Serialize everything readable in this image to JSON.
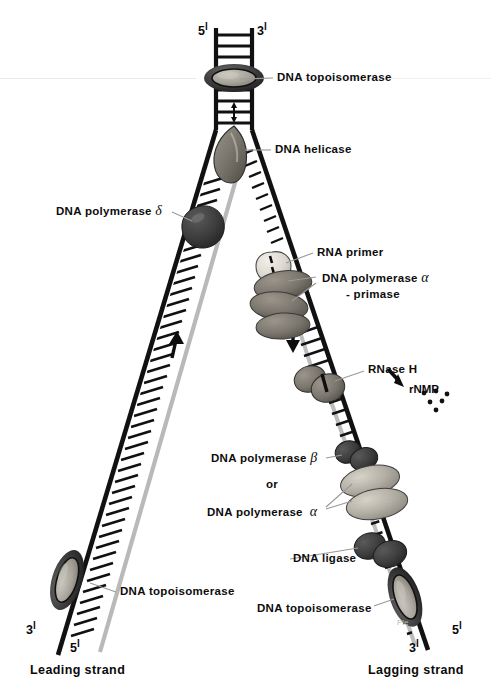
{
  "figure": {
    "background_color": "#ffffff",
    "width": 491,
    "height": 698
  },
  "colors": {
    "ink": "#0d0d0d",
    "template_strand": "#111111",
    "new_strand": "#b3b3b3",
    "leader_line": "#9a9a9a",
    "protein_dark": "#3a3a3a",
    "protein_mid": "#6e6e6e",
    "protein_light": "#b0aca4",
    "primer_light": "#e3e0d8",
    "watermark": "#b9b9b9"
  },
  "end_labels": [
    {
      "id": "top-left-5prime",
      "text": "5",
      "prime": "l",
      "x": 198,
      "y": 24
    },
    {
      "id": "top-right-3prime",
      "text": "3",
      "prime": "l",
      "x": 257,
      "y": 24
    },
    {
      "id": "bottom-left-3prime",
      "text": "3",
      "prime": "l",
      "x": 26,
      "y": 623
    },
    {
      "id": "bottom-left-5prime",
      "text": "5",
      "prime": "l",
      "x": 70,
      "y": 641
    },
    {
      "id": "bottom-right-3prime",
      "text": "3",
      "prime": "l",
      "x": 409,
      "y": 641
    },
    {
      "id": "bottom-right-5prime",
      "text": "5",
      "prime": "l",
      "x": 452,
      "y": 623
    }
  ],
  "annotations": [
    {
      "id": "dna-topoisomerase-top",
      "label": "DNA  topoisomerase",
      "x": 277,
      "y": 70,
      "leader": {
        "x1": 273,
        "y1": 78,
        "x2": 240,
        "y2": 79
      }
    },
    {
      "id": "dna-helicase",
      "label": "DNA  helicase",
      "x": 275,
      "y": 142,
      "leader": {
        "x1": 271,
        "y1": 150,
        "x2": 243,
        "y2": 150
      }
    },
    {
      "id": "dna-polymerase-delta",
      "label": "DNA  polymerase",
      "greek": "δ",
      "x": 56,
      "y": 202,
      "leader": {
        "x1": 172,
        "y1": 212,
        "x2": 193,
        "y2": 220
      }
    },
    {
      "id": "rna-primer",
      "label": "RNA  primer",
      "x": 317,
      "y": 245,
      "leader": {
        "x1": 313,
        "y1": 253,
        "x2": 287,
        "y2": 264
      }
    },
    {
      "id": "dna-polymerase-alpha-primase",
      "label": "DNA  polymerase",
      "greek": "α",
      "label2": "- primase",
      "x": 322,
      "y": 269,
      "leaders": [
        {
          "x1": 318,
          "y1": 277,
          "x2": 287,
          "y2": 281
        },
        {
          "x1": 318,
          "y1": 283,
          "x2": 290,
          "y2": 300
        }
      ]
    },
    {
      "id": "rnase-h",
      "label": "RNase  H",
      "x": 368,
      "y": 362,
      "leader": {
        "x1": 364,
        "y1": 371,
        "x2": 336,
        "y2": 381
      }
    },
    {
      "id": "rnmp",
      "label": "rNMP",
      "x": 409,
      "y": 383
    },
    {
      "id": "dna-polymerase-beta",
      "label": "DNA  polymerase",
      "greek": "β",
      "x": 211,
      "y": 449,
      "leader": {
        "x1": 325,
        "y1": 458,
        "x2": 343,
        "y2": 455
      }
    },
    {
      "id": "or-connector",
      "label": "or",
      "x": 266,
      "y": 477
    },
    {
      "id": "dna-polymerase-alpha",
      "label": "DNA  polymerase",
      "greek": "α",
      "x": 207,
      "y": 503,
      "leaders": [
        {
          "x1": 325,
          "y1": 507,
          "x2": 352,
          "y2": 483
        },
        {
          "x1": 325,
          "y1": 509,
          "x2": 352,
          "y2": 500
        }
      ]
    },
    {
      "id": "dna-ligase",
      "label": "DNA  ligase",
      "x": 293,
      "y": 551,
      "leader": {
        "x1": 289,
        "y1": 559,
        "x2": 362,
        "y2": 548
      }
    },
    {
      "id": "dna-topoisomerase-bottom-left",
      "label": "DNA  topoisomerase",
      "x": 120,
      "y": 584,
      "leader": {
        "x1": 116,
        "y1": 592,
        "x2": 92,
        "y2": 583
      }
    },
    {
      "id": "dna-topoisomerase-bottom-right",
      "label": "DNA  topoisomerase",
      "x": 257,
      "y": 601,
      "leader": {
        "x1": 373,
        "y1": 606,
        "x2": 394,
        "y2": 599
      }
    }
  ],
  "strand_labels": [
    {
      "id": "leading-strand",
      "text": "Leading  strand",
      "x": 30,
      "y": 663
    },
    {
      "id": "lagging-strand",
      "text": "Lagging  strand",
      "x": 368,
      "y": 663
    }
  ],
  "watermark": {
    "text": "Ple",
    "x": 397,
    "y": 618
  },
  "proteins": [
    {
      "id": "topoisomerase-top",
      "type": "ellipse-ring",
      "label": "DNA topoisomerase"
    },
    {
      "id": "helicase",
      "type": "wedge-blob",
      "label": "DNA helicase"
    },
    {
      "id": "polymerase-delta",
      "type": "dark-blob",
      "label": "DNA polymerase delta"
    },
    {
      "id": "rna-primer-blob",
      "type": "light-blob",
      "label": "RNA primer"
    },
    {
      "id": "polymerase-alpha-primase",
      "type": "triple-lobe",
      "label": "DNA polymerase alpha-primase"
    },
    {
      "id": "rnase-h-blob",
      "type": "dark-lobe",
      "label": "RNase H"
    },
    {
      "id": "polymerase-beta-blob",
      "type": "dark-lobe",
      "label": "DNA polymerase beta"
    },
    {
      "id": "polymerase-alpha-blob",
      "type": "double-lobe",
      "label": "DNA polymerase alpha"
    },
    {
      "id": "ligase-blob",
      "type": "dark-lobe",
      "label": "DNA ligase"
    },
    {
      "id": "topoisomerase-bottom-left",
      "type": "ellipse-ring",
      "label": "DNA topoisomerase"
    },
    {
      "id": "topoisomerase-bottom-right",
      "type": "ellipse-ring",
      "label": "DNA topoisomerase"
    }
  ],
  "arrows": [
    {
      "id": "helix-unwind-arrow",
      "direction": "vertical-double",
      "description": "unwinding arrow in duplex"
    },
    {
      "id": "leading-synthesis-arrow",
      "direction": "up",
      "description": "continuous synthesis direction"
    },
    {
      "id": "lagging-synthesis-arrow",
      "direction": "down",
      "description": "Okazaki fragment synthesis direction"
    },
    {
      "id": "rnmp-release-arrow",
      "direction": "down-right",
      "description": "rNMP release"
    }
  ]
}
